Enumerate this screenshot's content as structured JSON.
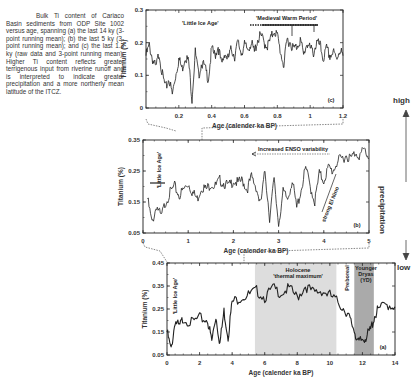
{
  "caption": {
    "text": "Bulk Ti content of Cariaco Basin sediments from ODP Site 1002 versus age, spanning (a) the last 14 ky (3-point running mean); (b) the last 5 ky (3-point running mean); and (c) the last 1.2 ky (raw data and 3-point running mean). Higher Ti content reflects greater terrigenous input from riverine runoff and is interpreted to indicate greater precipitation and a more northerly mean latitude of the ITCZ."
  },
  "side_axis": {
    "high": "high",
    "low": "low",
    "label": "precipitation"
  },
  "chart_data": [
    {
      "type": "line",
      "panel": "(c)",
      "title": "",
      "xlabel": "Age (calender ka BP)",
      "ylabel": "Titanium (%)",
      "xlim": [
        0,
        1.2
      ],
      "ylim": [
        0,
        0.3
      ],
      "xticks": [
        "0.2",
        "0.4",
        "0.6",
        "0.8",
        "1",
        "1.2"
      ],
      "yticks": [
        "0",
        "0.1",
        "0.2",
        "0.3"
      ],
      "annotations": [
        "'Little Ice Age'",
        "'Medieval Warm Period'"
      ],
      "series": [
        {
          "name": "Ti (raw + 3-pt mean)",
          "x": [
            0.0,
            0.02,
            0.04,
            0.06,
            0.08,
            0.1,
            0.12,
            0.14,
            0.16,
            0.18,
            0.2,
            0.22,
            0.24,
            0.26,
            0.28,
            0.3,
            0.32,
            0.34,
            0.36,
            0.38,
            0.4,
            0.42,
            0.44,
            0.46,
            0.48,
            0.5,
            0.52,
            0.54,
            0.56,
            0.58,
            0.6,
            0.62,
            0.64,
            0.66,
            0.68,
            0.7,
            0.72,
            0.74,
            0.76,
            0.78,
            0.8,
            0.82,
            0.84,
            0.86,
            0.88,
            0.9,
            0.92,
            0.94,
            0.96,
            0.98,
            1.0,
            1.02,
            1.04,
            1.06,
            1.08,
            1.1,
            1.12,
            1.14,
            1.16,
            1.18,
            1.2
          ],
          "values": [
            0.16,
            0.19,
            0.15,
            0.12,
            0.17,
            0.1,
            0.06,
            0.09,
            0.04,
            0.1,
            0.15,
            0.12,
            0.16,
            0.14,
            0.03,
            0.17,
            0.1,
            0.14,
            0.12,
            0.09,
            0.18,
            0.16,
            0.19,
            0.13,
            0.17,
            0.15,
            0.18,
            0.16,
            0.2,
            0.17,
            0.19,
            0.18,
            0.2,
            0.17,
            0.21,
            0.22,
            0.2,
            0.19,
            0.21,
            0.24,
            0.22,
            0.17,
            0.13,
            0.21,
            0.2,
            0.18,
            0.19,
            0.21,
            0.16,
            0.2,
            0.18,
            0.17,
            0.2,
            0.19,
            0.15,
            0.18,
            0.16,
            0.17,
            0.15,
            0.18,
            0.16
          ]
        }
      ]
    },
    {
      "type": "line",
      "panel": "(b)",
      "xlabel": "Age (calender ka BP)",
      "ylabel": "Titanium (%)",
      "xlim": [
        0,
        5
      ],
      "ylim": [
        0.05,
        0.35
      ],
      "xticks": [
        "0",
        "1",
        "2",
        "3",
        "4",
        "5"
      ],
      "yticks": [
        "0.05",
        "0.15",
        "0.25",
        "0.35"
      ],
      "annotations": [
        "'Little Ice Age'",
        "Increased ENSO variability",
        "strong El Nino"
      ],
      "series": [
        {
          "name": "Ti (3-pt mean)",
          "x": [
            0.1,
            0.2,
            0.3,
            0.4,
            0.5,
            0.6,
            0.7,
            0.8,
            0.9,
            1.0,
            1.1,
            1.2,
            1.3,
            1.4,
            1.5,
            1.6,
            1.7,
            1.8,
            1.9,
            2.0,
            2.1,
            2.2,
            2.3,
            2.4,
            2.5,
            2.6,
            2.7,
            2.8,
            2.9,
            3.0,
            3.1,
            3.2,
            3.3,
            3.4,
            3.5,
            3.6,
            3.7,
            3.8,
            3.9,
            4.0,
            4.1,
            4.2,
            4.3,
            4.4,
            4.5,
            4.6,
            4.7,
            4.8,
            4.9,
            5.0
          ],
          "values": [
            0.16,
            0.08,
            0.14,
            0.1,
            0.15,
            0.18,
            0.2,
            0.17,
            0.19,
            0.21,
            0.18,
            0.16,
            0.2,
            0.19,
            0.21,
            0.2,
            0.22,
            0.21,
            0.2,
            0.22,
            0.21,
            0.22,
            0.19,
            0.23,
            0.2,
            0.14,
            0.25,
            0.1,
            0.22,
            0.08,
            0.18,
            0.16,
            0.22,
            0.13,
            0.19,
            0.26,
            0.2,
            0.15,
            0.24,
            0.22,
            0.26,
            0.25,
            0.28,
            0.29,
            0.3,
            0.29,
            0.31,
            0.3,
            0.32,
            0.29
          ]
        }
      ]
    },
    {
      "type": "line",
      "panel": "(a)",
      "xlabel": "Age (calender ka BP)",
      "ylabel": "Titanium (%)",
      "xlim": [
        0,
        14
      ],
      "ylim": [
        0.05,
        0.45
      ],
      "xticks": [
        "0",
        "2",
        "4",
        "6",
        "8",
        "10",
        "12",
        "14"
      ],
      "yticks": [
        "0.05",
        "0.15",
        "0.25",
        "0.35",
        "0.45"
      ],
      "annotations": [
        "'Little Ice Age'",
        "Holocene 'thermal maximum'",
        "Preboreal",
        "Younger Dryas (YD)"
      ],
      "shaded_regions": [
        {
          "label": "Holocene 'thermal maximum'",
          "x": [
            5.4,
            10.4
          ],
          "color": "#dddddd"
        },
        {
          "label": "Younger Dryas (YD)",
          "x": [
            11.5,
            12.7
          ],
          "color": "#aaaaaa"
        }
      ],
      "series": [
        {
          "name": "Ti (3-pt mean)",
          "x": [
            0,
            0.25,
            0.5,
            0.75,
            1,
            1.5,
            2,
            2.5,
            2.75,
            3,
            3.25,
            3.5,
            3.75,
            4,
            4.5,
            5,
            5.5,
            6,
            6.5,
            7,
            7.5,
            8,
            8.5,
            9,
            9.5,
            10,
            10.5,
            11,
            11.25,
            11.5,
            11.75,
            12,
            12.25,
            12.5,
            12.75,
            13,
            13.5,
            14
          ],
          "values": [
            0.15,
            0.07,
            0.2,
            0.17,
            0.21,
            0.19,
            0.21,
            0.2,
            0.11,
            0.22,
            0.1,
            0.24,
            0.13,
            0.28,
            0.3,
            0.31,
            0.33,
            0.3,
            0.34,
            0.32,
            0.34,
            0.3,
            0.35,
            0.32,
            0.33,
            0.31,
            0.28,
            0.24,
            0.2,
            0.16,
            0.1,
            0.12,
            0.13,
            0.16,
            0.22,
            0.25,
            0.27,
            0.26
          ]
        }
      ]
    }
  ]
}
